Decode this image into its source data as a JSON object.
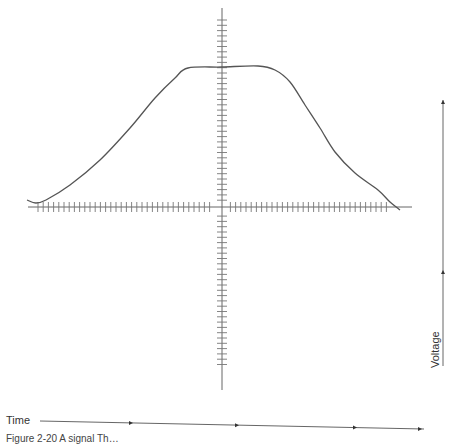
{
  "diagram": {
    "type": "waveform",
    "labels": {
      "x_axis": "Time",
      "y_axis": "Voltage"
    },
    "caption": "Figure 2-20  A signal Th…",
    "colors": {
      "curve": "#555555",
      "axis": "#666666",
      "ticks": "#777777",
      "background": "#ffffff"
    },
    "axes": {
      "vertical_axis_x": 222,
      "vertical_axis_y_range": [
        8,
        390
      ],
      "horizontal_axis_y": 207,
      "horizontal_axis_x_range": [
        28,
        412
      ],
      "vertical_tick_spacing": 5.3,
      "horizontal_tick_spacing": 5.2
    },
    "curve_points": [
      [
        27,
        200
      ],
      [
        36,
        203
      ],
      [
        46,
        200
      ],
      [
        70,
        185
      ],
      [
        100,
        160
      ],
      [
        130,
        128
      ],
      [
        155,
        98
      ],
      [
        175,
        78
      ],
      [
        188,
        68
      ],
      [
        222,
        67
      ],
      [
        258,
        66
      ],
      [
        275,
        70
      ],
      [
        290,
        82
      ],
      [
        305,
        105
      ],
      [
        320,
        128
      ],
      [
        335,
        152
      ],
      [
        355,
        173
      ],
      [
        378,
        190
      ],
      [
        390,
        202
      ],
      [
        400,
        210
      ]
    ],
    "time_arrow": {
      "y_start": 421,
      "y_end": 429,
      "x_start": 40,
      "x_end": 424,
      "markers_x": [
        133,
        239,
        357,
        422
      ]
    },
    "voltage_arrow": {
      "x": 443,
      "y_start": 366,
      "y_end": 100,
      "markers_y": [
        270,
        100
      ]
    }
  }
}
